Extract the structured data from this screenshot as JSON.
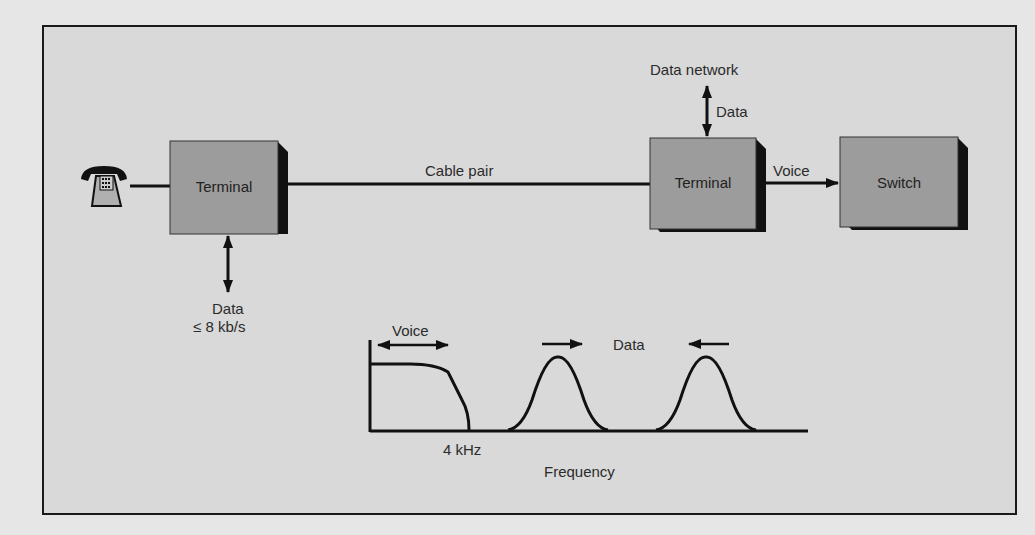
{
  "diagram": {
    "nodes": [
      {
        "id": "telephone",
        "label": ""
      },
      {
        "id": "terminal_left",
        "label": "Terminal"
      },
      {
        "id": "terminal_right",
        "label": "Terminal"
      },
      {
        "id": "switch",
        "label": "Switch"
      }
    ],
    "edges": [
      {
        "from": "telephone",
        "to": "terminal_left",
        "label": ""
      },
      {
        "from": "terminal_left",
        "to": "terminal_right",
        "label": "Cable pair"
      },
      {
        "from": "terminal_right",
        "to": "switch",
        "label": "Voice"
      },
      {
        "from": "terminal_right",
        "to": "data_network",
        "label": "Data"
      },
      {
        "from": "terminal_left",
        "to": "data_port",
        "label": "Data ≤ 8 kb/s"
      }
    ],
    "labels": {
      "terminal_left": "Terminal",
      "terminal_right": "Terminal",
      "switch": "Switch",
      "cable_pair": "Cable pair",
      "voice": "Voice",
      "data_network": "Data network",
      "data_up": "Data",
      "data_down_1": "Data",
      "data_down_2": "≤ 8 kb/s"
    },
    "spectrum": {
      "voice_label": "Voice",
      "data_label": "Data",
      "cutoff_label": "4 kHz",
      "axis_label": "Frequency"
    }
  }
}
